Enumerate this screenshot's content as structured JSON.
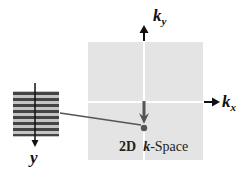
{
  "diagram": {
    "kspace_label_prefix": "2D",
    "kspace_label_k": "k",
    "kspace_label_suffix": "-Space",
    "axis_ky": {
      "main": "k",
      "sub": "y"
    },
    "axis_kx": {
      "main": "k",
      "sub": "x"
    },
    "axis_y": "y",
    "colors": {
      "kspace_fill": "#e4e4e4",
      "stripe_dark": "#444444",
      "stripe_light": "#bdbdbd",
      "arrow": "#111111",
      "connector": "#555555",
      "point": "#555555"
    }
  }
}
